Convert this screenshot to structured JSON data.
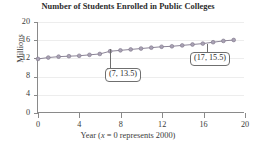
{
  "chart_data": {
    "type": "line",
    "title": "Number of Students Enrolled in Public Colleges",
    "xlabel_prefix": "Year (",
    "xlabel_var": "x",
    "xlabel_suffix": " = 0 represents 2000)",
    "xlabel": "Year (x = 0 represents 2000)",
    "ylabel": "Millions",
    "xlim": [
      0,
      20
    ],
    "ylim": [
      0,
      20
    ],
    "xticks": [
      0,
      4,
      8,
      12,
      16,
      20
    ],
    "yticks": [
      0,
      4,
      8,
      12,
      16,
      20
    ],
    "grid": "horizontal",
    "legend": "none",
    "series": [
      {
        "name": "Public college enrollment",
        "marker": "circle",
        "color": "#a9a2b4",
        "line_color": "#7d7589",
        "x": [
          0,
          1,
          2,
          3,
          4,
          5,
          6,
          7,
          8,
          9,
          10,
          11,
          12,
          13,
          14,
          15,
          16,
          17,
          18,
          19
        ],
        "values": [
          11.8,
          12.1,
          12.3,
          12.4,
          12.5,
          12.7,
          12.9,
          13.5,
          13.7,
          13.9,
          14.1,
          14.3,
          14.5,
          14.6,
          14.8,
          15.0,
          15.2,
          15.5,
          15.8,
          16.0
        ]
      }
    ],
    "annotations": [
      {
        "label": "(7, 13.5)",
        "x": 7,
        "y": 13.5
      },
      {
        "label": "(17, 15.5)",
        "x": 17,
        "y": 15.5
      }
    ]
  }
}
